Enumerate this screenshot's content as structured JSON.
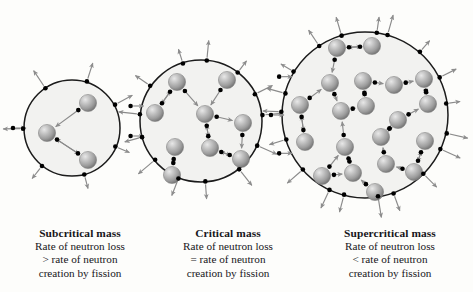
{
  "diagram": {
    "background_color": "#fdfdfb",
    "sphere_color_light": "#dcdcdc",
    "sphere_color_mid": "#a8a8a8",
    "sphere_color_dark": "#6f6f6f",
    "neutron_color": "#000000",
    "arrow_color": "#8a8a8a",
    "circle_stroke": "#1b1b1b",
    "circle_fill": "#f2f2f0",
    "panels": [
      {
        "id": "subcritical",
        "icon": "mass-circle-icon",
        "circle": {
          "cx": 72,
          "cy": 128,
          "r": 48
        },
        "nucleus_count": 3,
        "nuclei": [
          {
            "x": 47,
            "y": 133
          },
          {
            "x": 88,
            "y": 103
          },
          {
            "x": 88,
            "y": 160
          }
        ],
        "caption": {
          "title": "Subcritical mass",
          "lines": [
            "Rate of neutron loss",
            "> rate of neutron",
            "creation by fission"
          ]
        }
      },
      {
        "id": "critical",
        "icon": "mass-circle-icon",
        "circle": {
          "cx": 201,
          "cy": 121,
          "r": 61
        },
        "nucleus_count": 9,
        "nuclei": [
          {
            "x": 177,
            "y": 82
          },
          {
            "x": 227,
            "y": 80
          },
          {
            "x": 155,
            "y": 113
          },
          {
            "x": 205,
            "y": 114
          },
          {
            "x": 243,
            "y": 123
          },
          {
            "x": 175,
            "y": 147
          },
          {
            "x": 210,
            "y": 148
          },
          {
            "x": 241,
            "y": 159
          },
          {
            "x": 172,
            "y": 175
          }
        ],
        "caption": {
          "title": "Critical mass",
          "lines": [
            "Rate of neutron loss",
            "= rate of neutron",
            "creation by fission"
          ]
        }
      },
      {
        "id": "supercritical",
        "icon": "mass-circle-icon",
        "circle": {
          "cx": 365,
          "cy": 115,
          "r": 83
        },
        "nucleus_count": 20,
        "nuclei": [
          {
            "x": 337,
            "y": 48
          },
          {
            "x": 372,
            "y": 46
          },
          {
            "x": 330,
            "y": 83
          },
          {
            "x": 363,
            "y": 81
          },
          {
            "x": 394,
            "y": 85
          },
          {
            "x": 424,
            "y": 79
          },
          {
            "x": 300,
            "y": 105
          },
          {
            "x": 341,
            "y": 111
          },
          {
            "x": 366,
            "y": 106
          },
          {
            "x": 398,
            "y": 120
          },
          {
            "x": 428,
            "y": 104
          },
          {
            "x": 305,
            "y": 142
          },
          {
            "x": 345,
            "y": 147
          },
          {
            "x": 381,
            "y": 137
          },
          {
            "x": 425,
            "y": 141
          },
          {
            "x": 322,
            "y": 176
          },
          {
            "x": 353,
            "y": 173
          },
          {
            "x": 386,
            "y": 164
          },
          {
            "x": 414,
            "y": 172
          },
          {
            "x": 375,
            "y": 192
          }
        ],
        "caption": {
          "title": "Supercritical mass",
          "lines": [
            "Rate of neutron loss",
            "< rate of neutron",
            "creation by fission"
          ]
        }
      }
    ]
  }
}
